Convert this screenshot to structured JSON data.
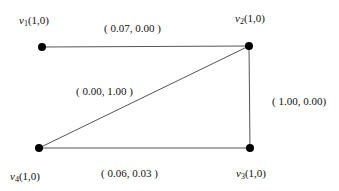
{
  "graph": {
    "nodes": [
      {
        "id": "v1",
        "name": "v",
        "sub": "1",
        "value": "(1,0)",
        "x": 42,
        "y": 47,
        "label_x": 19,
        "label_y": 15
      },
      {
        "id": "v2",
        "name": "v",
        "sub": "2",
        "value": "(1,0)",
        "x": 249,
        "y": 46,
        "label_x": 235,
        "label_y": 13
      },
      {
        "id": "v3",
        "name": "v",
        "sub": "3",
        "value": "(1,0)",
        "x": 250,
        "y": 148,
        "label_x": 236,
        "label_y": 167
      },
      {
        "id": "v4",
        "name": "v",
        "sub": "4",
        "value": "(1,0)",
        "x": 39,
        "y": 148,
        "label_x": 10,
        "label_y": 170
      }
    ],
    "edges": [
      {
        "from": "v1",
        "to": "v2",
        "label": "( 0.07, 0.00 )",
        "label_x": 104,
        "label_y": 22
      },
      {
        "from": "v2",
        "to": "v3",
        "label": "( 1.00, 0.00)",
        "label_x": 272,
        "label_y": 96
      },
      {
        "from": "v4",
        "to": "v3",
        "label": "( 0.06, 0.03 )",
        "label_x": 101,
        "label_y": 167
      },
      {
        "from": "v4",
        "to": "v2",
        "label": "( 0.00, 1.00 )",
        "label_x": 76,
        "label_y": 86
      }
    ],
    "colors": {
      "edge": "#555555",
      "node": "#000000",
      "text": "#111111"
    }
  }
}
